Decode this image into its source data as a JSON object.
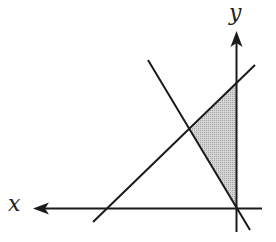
{
  "diagram": {
    "type": "linear-inequality-region",
    "axes": {
      "x_label": "x",
      "y_label": "y",
      "x_axis_direction": "left",
      "y_axis_direction": "up"
    },
    "lines": [
      {
        "name": "rising-line",
        "from": [
          93,
          222
        ],
        "to": [
          255,
          65
        ]
      },
      {
        "name": "falling-line",
        "from": [
          148,
          60
        ],
        "to": [
          250,
          230
        ]
      }
    ],
    "shaded_region": {
      "vertices": [
        [
          190,
          130
        ],
        [
          236,
          84
        ],
        [
          236,
          208
        ]
      ],
      "fill": "#c8c8c8"
    },
    "colors": {
      "stroke": "#1a1a1a",
      "shade": "#c8c8c8"
    }
  }
}
